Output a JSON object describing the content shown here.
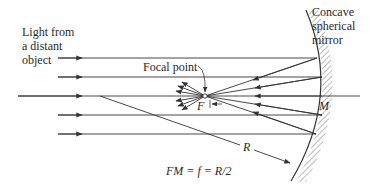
{
  "diagram": {
    "labels": {
      "source": [
        "Light from",
        "a distant",
        "object"
      ],
      "mirror": [
        "Concave",
        "spherical",
        "mirror"
      ],
      "focal_point": "Focal point",
      "F": "F",
      "M": "M",
      "R": "R",
      "equation": "FM = f = R/2"
    },
    "colors": {
      "line": "#333333",
      "text": "#2a2a2a",
      "background": "#ffffff"
    }
  }
}
